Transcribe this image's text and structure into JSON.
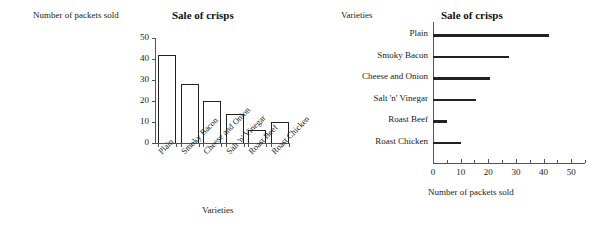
{
  "chart_data": [
    {
      "type": "bar",
      "orientation": "vertical",
      "title": "Sale of crisps",
      "xlabel": "Varieties",
      "ylabel": "Number of packets sold",
      "categories": [
        "Plain",
        "Smoky Bacon",
        "Cheese and Onion",
        "Salt 'n' Vinegar",
        "Roast Beef",
        "Roast Chicken"
      ],
      "values": [
        42,
        28,
        20,
        14,
        6,
        10
      ],
      "ylim": [
        0,
        50
      ],
      "yticks": [
        0,
        10,
        20,
        30,
        40,
        50
      ],
      "ytick_labels": [
        "0",
        "10",
        "20",
        "30",
        "40",
        "50"
      ],
      "grid": false,
      "legend": false,
      "bar_fill": "#ffffff",
      "bar_edge": "#222222"
    },
    {
      "type": "bar",
      "orientation": "horizontal",
      "title": "Sale of crisps",
      "xlabel": "Number of packets sold",
      "ylabel": "Varieties",
      "categories": [
        "Plain",
        "Smoky Bacon",
        "Cheese and Onion",
        "Salt 'n' Vinegar",
        "Roast Beef",
        "Roast Chicken"
      ],
      "values": [
        42,
        27.5,
        20.5,
        15.5,
        5,
        10
      ],
      "xlim": [
        0,
        55
      ],
      "xticks": [
        0,
        10,
        20,
        30,
        40,
        50
      ],
      "xtick_labels": [
        "0",
        "10",
        "20",
        "30",
        "40",
        "50"
      ],
      "grid": false,
      "legend": false,
      "bar_color": "#222222"
    }
  ],
  "left_chart": {
    "title": "Sale of crisps",
    "y_axis_name": "Number of packets sold",
    "x_axis_name": "Varieties",
    "y_ticks": [
      {
        "label": "50"
      },
      {
        "label": "40"
      },
      {
        "label": "30"
      },
      {
        "label": "20"
      },
      {
        "label": "10"
      },
      {
        "label": "0"
      }
    ],
    "bars": [
      {
        "label": "Plain",
        "value": 42
      },
      {
        "label": "Smoky Bacon",
        "value": 28
      },
      {
        "label": "Cheese and Onion",
        "value": 20
      },
      {
        "label": "Salt 'n' Vinegar",
        "value": 14
      },
      {
        "label": "Roast Beef",
        "value": 6
      },
      {
        "label": "Roast Chicken",
        "value": 10
      }
    ]
  },
  "right_chart": {
    "title": "Sale of crisps",
    "y_axis_name": "Varieties",
    "x_axis_name": "Number of packets sold",
    "x_ticks": [
      {
        "label": "0"
      },
      {
        "label": "10"
      },
      {
        "label": "20"
      },
      {
        "label": "30"
      },
      {
        "label": "40"
      },
      {
        "label": "50"
      }
    ],
    "bars": [
      {
        "label": "Plain",
        "value": 42
      },
      {
        "label": "Smoky Bacon",
        "value": 27.5
      },
      {
        "label": "Cheese and Onion",
        "value": 20.5
      },
      {
        "label": "Salt 'n' Vinegar",
        "value": 15.5
      },
      {
        "label": "Roast Beef",
        "value": 5
      },
      {
        "label": "Roast Chicken",
        "value": 10
      }
    ]
  }
}
